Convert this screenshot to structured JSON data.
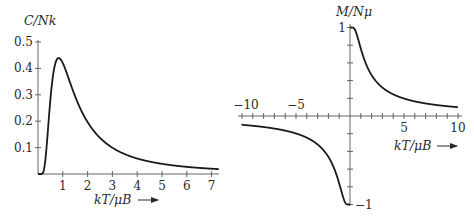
{
  "chart_data": [
    {
      "type": "line",
      "title": "",
      "ylabel": "C/Nk",
      "xlabel": "kT/μB",
      "xlabel_arrow": true,
      "xlim": [
        0,
        7.3
      ],
      "ylim": [
        0,
        0.5
      ],
      "xticks": [
        1,
        2,
        3,
        4,
        5,
        6,
        7
      ],
      "xtick_labels": [
        "1",
        "2",
        "3",
        "4",
        "5",
        "6",
        "7"
      ],
      "yticks": [
        0.1,
        0.2,
        0.3,
        0.4,
        0.5
      ],
      "ytick_labels": [
        "0.1",
        "0.2",
        "0.3",
        "0.4",
        "0.5"
      ],
      "grid": false,
      "function": "(1/t)^2 * sech^2(1/t)",
      "series": [
        {
          "name": "heat capacity",
          "x": [
            0.1,
            0.2,
            0.3,
            0.4,
            0.5,
            0.6,
            0.7,
            0.83,
            1.0,
            1.25,
            1.5,
            2.0,
            2.5,
            3.0,
            4.0,
            5.0,
            6.0,
            7.0,
            7.3
          ],
          "y": [
            0.0,
            0.0018,
            0.0397,
            0.1105,
            0.2826,
            0.3627,
            0.4144,
            0.4392,
            0.42,
            0.3432,
            0.2646,
            0.1966,
            0.1417,
            0.1003,
            0.0594,
            0.0392,
            0.0276,
            0.0203,
            0.0187
          ]
        }
      ]
    },
    {
      "type": "line",
      "title": "",
      "ylabel": "M/Nμ",
      "xlabel": "kT/μB",
      "xlabel_arrow": true,
      "xlim": [
        -10,
        10
      ],
      "ylim": [
        -1,
        1
      ],
      "xticks_labeled": [
        -10,
        -5,
        5,
        10
      ],
      "xtick_labels": [
        "−10",
        "−5",
        "5",
        "10"
      ],
      "xtick_minor_step": 1,
      "yticks_labeled": [
        1,
        -1
      ],
      "ytick_labels": [
        "1",
        "−1"
      ],
      "ytick_minor_step": 0.2,
      "grid": false,
      "function": "tanh(1/t)",
      "series": [
        {
          "name": "magnetization (t>0)",
          "x": [
            0.1,
            0.3,
            0.5,
            0.75,
            1,
            1.5,
            2,
            3,
            4,
            5,
            7,
            10
          ],
          "y": [
            1.0,
            0.9975,
            0.964,
            0.8701,
            0.7616,
            0.5828,
            0.4621,
            0.3215,
            0.2449,
            0.1974,
            0.1419,
            0.0997
          ]
        },
        {
          "name": "magnetization (t<0)",
          "x": [
            -10,
            -7,
            -5,
            -4,
            -3,
            -2,
            -1.5,
            -1,
            -0.75,
            -0.5,
            -0.3,
            -0.1
          ],
          "y": [
            -0.0997,
            -0.1419,
            -0.1974,
            -0.2449,
            -0.3215,
            -0.4621,
            -0.5828,
            -0.7616,
            -0.8701,
            -0.964,
            -0.9975,
            -1.0
          ]
        }
      ]
    }
  ]
}
